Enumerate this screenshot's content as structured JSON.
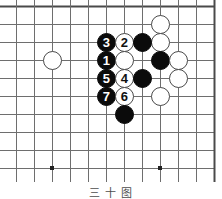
{
  "figure": {
    "caption": "三 十 图",
    "type": "go-board-diagram"
  },
  "board": {
    "line_color": "#6e6e6e",
    "border_color": "#4a4a4a",
    "background_color": "#ffffff",
    "cell_size": 18,
    "origin_x": 16,
    "origin_y": 6,
    "cols": 12,
    "rows": 10,
    "star_points": [
      {
        "col": 2,
        "row": 9
      },
      {
        "col": 8,
        "row": 9
      }
    ],
    "star_point_color": "#222222"
  },
  "stones": [
    {
      "col": 2,
      "row": 3,
      "color": "white",
      "label": ""
    },
    {
      "col": 8,
      "row": 1,
      "color": "white",
      "label": ""
    },
    {
      "col": 8,
      "row": 2,
      "color": "white",
      "label": ""
    },
    {
      "col": 5,
      "row": 2,
      "color": "black",
      "label": "3"
    },
    {
      "col": 6,
      "row": 2,
      "color": "white",
      "label": "2"
    },
    {
      "col": 7,
      "row": 2,
      "color": "black",
      "label": ""
    },
    {
      "col": 5,
      "row": 3,
      "color": "black",
      "label": "1"
    },
    {
      "col": 6,
      "row": 3,
      "color": "white",
      "label": ""
    },
    {
      "col": 8,
      "row": 3,
      "color": "black",
      "label": ""
    },
    {
      "col": 9,
      "row": 3,
      "color": "white",
      "label": ""
    },
    {
      "col": 5,
      "row": 4,
      "color": "black",
      "label": "5"
    },
    {
      "col": 6,
      "row": 4,
      "color": "white",
      "label": "4"
    },
    {
      "col": 7,
      "row": 4,
      "color": "black",
      "label": ""
    },
    {
      "col": 9,
      "row": 4,
      "color": "white",
      "label": ""
    },
    {
      "col": 5,
      "row": 5,
      "color": "black",
      "label": "7"
    },
    {
      "col": 6,
      "row": 5,
      "color": "white",
      "label": "6"
    },
    {
      "col": 8,
      "row": 5,
      "color": "white",
      "label": ""
    },
    {
      "col": 6,
      "row": 6,
      "color": "black",
      "label": ""
    }
  ],
  "move_numbers": [
    "1",
    "2",
    "3",
    "4",
    "5",
    "6",
    "7"
  ]
}
